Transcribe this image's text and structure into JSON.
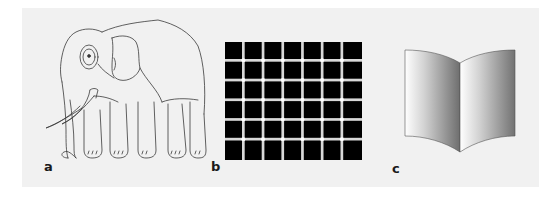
{
  "figure": {
    "background_color": "#f1f1f1",
    "panels": [
      {
        "id": "a",
        "label": "a",
        "subject": "elephant-line-drawing",
        "description": "Line drawing of an elephant (impossible figure: leg count ambiguity)"
      },
      {
        "id": "b",
        "label": "b",
        "subject": "scintillating-grid",
        "description": "Grid of black squares separated by light gray lines with white dots at intersections",
        "grid": {
          "columns": 7,
          "rows": 6,
          "square_color": "#000000",
          "line_color": "#d9d9d9",
          "dot_color": "#ffffff"
        }
      },
      {
        "id": "c",
        "label": "c",
        "subject": "ambiguous-book",
        "description": "Open book figure shaded with gradients (Mach book illusion)",
        "colors": {
          "light": "#ffffff",
          "dark": "#6e6e6e",
          "outline": "#555555"
        }
      }
    ]
  }
}
